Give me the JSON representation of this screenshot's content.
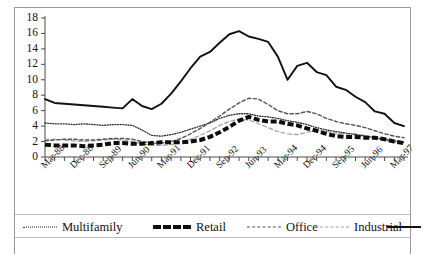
{
  "figure": {
    "background": "#ffffff",
    "frame_color": "#9a9a9a"
  },
  "axis": {
    "y_ticks": [
      "0",
      "2",
      "4",
      "6",
      "8",
      "10",
      "12",
      "14",
      "16",
      "18"
    ],
    "x_ticks_labeled": [
      "Mar-88",
      "Dec-88",
      "Sep-89",
      "Jun-90",
      "Mar-91",
      "Dec-91",
      "Sep-92",
      "Jun-93",
      "Mar-94",
      "Dec-94",
      "Sep-95",
      "Jun-96",
      "Mar-97"
    ]
  },
  "legend": {
    "items": [
      {
        "label": "Multifamily",
        "style": "dotted",
        "color": "#2b2b2b"
      },
      {
        "label": "Retail",
        "style": "thick-dashed",
        "color": "#0d0d0d"
      },
      {
        "label": "Office",
        "style": "dashed",
        "color": "#555555"
      },
      {
        "label": "Industrial",
        "style": "light-dashed",
        "color": "#9e9e9e"
      },
      {
        "label": "",
        "style": "solid",
        "color": "#111111"
      }
    ]
  },
  "chart_data": {
    "type": "line",
    "title": "",
    "xlabel": "",
    "ylabel": "",
    "ylim": [
      0,
      18
    ],
    "ytick_step": 2,
    "grid": false,
    "legend_position": "bottom",
    "x": [
      "Mar-88",
      "Jun-88",
      "Sep-88",
      "Dec-88",
      "Mar-89",
      "Jun-89",
      "Sep-89",
      "Dec-89",
      "Mar-90",
      "Jun-90",
      "Sep-90",
      "Dec-90",
      "Mar-91",
      "Jun-91",
      "Sep-91",
      "Dec-91",
      "Mar-92",
      "Jun-92",
      "Sep-92",
      "Dec-92",
      "Mar-93",
      "Jun-93",
      "Sep-93",
      "Dec-93",
      "Mar-94",
      "Jun-94",
      "Sep-94",
      "Dec-94",
      "Mar-95",
      "Jun-95",
      "Sep-95",
      "Dec-95",
      "Mar-96",
      "Jun-96",
      "Sep-96",
      "Dec-96",
      "Mar-97",
      "Jun-97"
    ],
    "x_tick_label_every": 3,
    "series": [
      {
        "name": "Multifamily",
        "style": "dotted",
        "color": "#2b2b2b",
        "values": [
          4.4,
          4.3,
          4.3,
          4.2,
          4.3,
          4.2,
          4.1,
          4.2,
          4.2,
          4.1,
          3.5,
          2.8,
          2.7,
          2.9,
          3.2,
          3.6,
          4.0,
          4.4,
          5.0,
          5.4,
          5.6,
          5.6,
          5.3,
          5.2,
          5.0,
          4.7,
          4.5,
          4.2,
          3.8,
          3.5,
          3.3,
          3.1,
          2.9,
          2.7,
          2.5,
          2.3,
          2.1,
          1.9
        ]
      },
      {
        "name": "Retail",
        "style": "thick-dashed",
        "color": "#0d0d0d",
        "values": [
          1.6,
          1.5,
          1.5,
          1.5,
          1.4,
          1.5,
          1.6,
          1.8,
          1.8,
          1.7,
          1.7,
          1.8,
          1.9,
          1.9,
          1.9,
          2.0,
          2.2,
          2.6,
          3.2,
          3.9,
          4.7,
          5.2,
          4.8,
          4.6,
          4.6,
          4.3,
          4.1,
          3.7,
          3.4,
          3.0,
          2.7,
          2.6,
          2.6,
          2.5,
          2.5,
          2.3,
          2.0,
          1.8
        ]
      },
      {
        "name": "Office",
        "style": "dashed",
        "color": "#555555",
        "values": [
          2.1,
          2.2,
          2.3,
          2.3,
          2.2,
          2.2,
          2.3,
          2.4,
          2.4,
          2.3,
          2.0,
          1.8,
          1.8,
          2.0,
          2.4,
          3.0,
          3.7,
          4.5,
          5.3,
          6.2,
          7.0,
          7.6,
          7.5,
          6.8,
          6.0,
          5.6,
          5.6,
          5.9,
          5.6,
          5.0,
          4.6,
          4.3,
          4.1,
          3.8,
          3.4,
          3.0,
          2.7,
          2.5
        ]
      },
      {
        "name": "Industrial",
        "style": "light-dashed",
        "color": "#9e9e9e",
        "values": [
          2.3,
          2.3,
          2.2,
          2.1,
          2.0,
          2.1,
          2.2,
          2.3,
          2.2,
          2.0,
          1.7,
          1.5,
          1.5,
          1.6,
          1.9,
          2.3,
          2.8,
          3.4,
          4.1,
          4.6,
          4.9,
          4.8,
          4.3,
          3.8,
          3.3,
          3.0,
          2.9,
          3.2,
          3.4,
          3.3,
          3.1,
          3.0,
          3.0,
          2.8,
          2.5,
          2.2,
          1.9,
          1.7
        ]
      },
      {
        "name": "",
        "style": "solid",
        "color": "#111111",
        "values": [
          7.5,
          7.0,
          6.9,
          6.8,
          6.7,
          6.6,
          6.5,
          6.4,
          6.3,
          7.5,
          6.6,
          6.2,
          6.9,
          8.2,
          9.8,
          11.5,
          13.0,
          13.6,
          14.8,
          15.9,
          16.3,
          15.6,
          15.3,
          14.9,
          13.0,
          10.0,
          11.8,
          12.2,
          11.0,
          10.6,
          9.1,
          8.7,
          7.8,
          7.1,
          5.9,
          5.6,
          4.4,
          4.0
        ]
      }
    ]
  }
}
